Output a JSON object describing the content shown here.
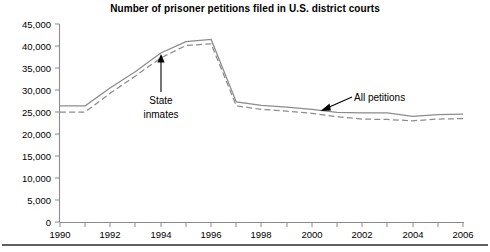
{
  "chart_data": {
    "type": "line",
    "title": "Number of prisoner petitions filed in U.S. district courts",
    "xlabel": "",
    "ylabel": "",
    "x": [
      1990,
      1991,
      1992,
      1993,
      1994,
      1995,
      1996,
      1997,
      1998,
      1999,
      2000,
      2001,
      2002,
      2003,
      2004,
      2005,
      2006
    ],
    "xlim": [
      1990,
      2006
    ],
    "ylim": [
      0,
      45000
    ],
    "ytick_labels": [
      "0",
      "5,000",
      "10,000",
      "15,000",
      "20,000",
      "25,000",
      "30,000",
      "35,000",
      "40,000",
      "45,000"
    ],
    "ytick_values": [
      0,
      5000,
      10000,
      15000,
      20000,
      25000,
      30000,
      35000,
      40000,
      45000
    ],
    "xtick_labels": [
      "1990",
      "1992",
      "1994",
      "1996",
      "1998",
      "2000",
      "2002",
      "2004",
      "2006"
    ],
    "xtick_values": [
      1990,
      1992,
      1994,
      1996,
      1998,
      2000,
      2002,
      2004,
      2006
    ],
    "xminor_values": [
      1991,
      1993,
      1995,
      1997,
      1999,
      2001,
      2003,
      2005
    ],
    "grid": false,
    "legend_position": "inline-annotations",
    "series": [
      {
        "name": "All petitions",
        "style": "solid",
        "color": "#8c8c8c",
        "values": [
          26400,
          26400,
          30500,
          34200,
          38400,
          41000,
          41500,
          27300,
          26500,
          26100,
          25600,
          24900,
          24800,
          24800,
          24000,
          24400,
          24500
        ]
      },
      {
        "name": "State inmates",
        "style": "dashed",
        "color": "#8c8c8c",
        "values": [
          25000,
          25000,
          29300,
          33200,
          37300,
          40100,
          40500,
          26400,
          25600,
          25200,
          24700,
          23900,
          23400,
          23300,
          23000,
          23400,
          23500
        ]
      }
    ],
    "annotations": [
      {
        "text_line1": "State",
        "text_line2": "inmates",
        "points_to_series": "State inmates",
        "points_to_year": 1994,
        "arrow_direction": "up"
      },
      {
        "text_line1": "All petitions",
        "text_line2": "",
        "points_to_series": "All petitions",
        "points_to_year": 2001,
        "arrow_direction": "down-left"
      }
    ]
  },
  "colors": {
    "axis": "#8a8a8a",
    "series": "#8c8c8c",
    "text": "#000000",
    "rule": "#2b2b2b",
    "background": "#ffffff"
  }
}
